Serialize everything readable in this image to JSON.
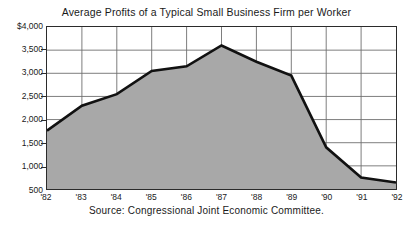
{
  "chart_data": {
    "type": "area",
    "title": "Average Profits of a Typical Small Business Firm per Worker",
    "xlabel": "",
    "ylabel": "",
    "categories": [
      "'82",
      "'83",
      "'84",
      "'85",
      "'86",
      "'87",
      "'88",
      "'89",
      "'90",
      "'91",
      "'92"
    ],
    "values": [
      1760,
      2300,
      2550,
      3050,
      3150,
      3600,
      3250,
      2950,
      1400,
      750,
      640
    ],
    "ylim": [
      500,
      4000
    ],
    "ytick_values": [
      4000,
      3500,
      3000,
      2500,
      2000,
      1500,
      1000,
      500
    ],
    "ytick_labels": [
      "$4,000",
      "3,500",
      "3,000",
      "2,500",
      "2,000",
      "1,500",
      "1,000",
      "500"
    ],
    "xtick_labels": [
      "'82",
      "'83",
      "'84",
      "'85",
      "'86",
      "'87",
      "'88",
      "'89",
      "'90",
      "'91",
      "'92"
    ],
    "grid": true,
    "legend": "none",
    "series": [
      {
        "name": "Average profits per worker",
        "values": [
          1760,
          2300,
          2550,
          3050,
          3150,
          3600,
          3250,
          2950,
          1400,
          750,
          640
        ]
      }
    ],
    "annotations": [],
    "fill_color": "#a8a8a8",
    "line_color": "#111111",
    "grid_color": "#6e6e6e",
    "frame_color": "#2b2b2b",
    "background_color": "#ffffff"
  },
  "caption": {
    "source_text": "Source: Congressional Joint Economic Committee."
  }
}
